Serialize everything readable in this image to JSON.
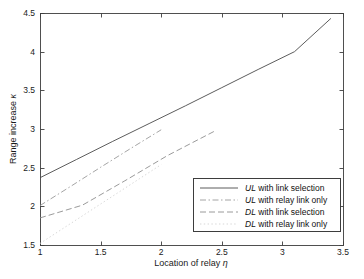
{
  "chart_data": {
    "type": "line",
    "title": "",
    "xlabel": "Location of relay η",
    "xlabel_text": "Location of relay",
    "xlabel_symbol": "η",
    "ylabel": "Range increase κ",
    "ylabel_text": "Range increase",
    "ylabel_symbol": "κ",
    "xlim": [
      1,
      3.5
    ],
    "ylim": [
      1.5,
      4.5
    ],
    "xticks": [
      1,
      1.5,
      2,
      2.5,
      3,
      3.5
    ],
    "xticklabels": [
      "1",
      "1.5",
      "2",
      "2.5",
      "3",
      "3.5"
    ],
    "yticks": [
      1.5,
      2,
      2.5,
      3,
      3.5,
      4,
      4.5
    ],
    "yticklabels": [
      "1.5",
      "2",
      "2.5",
      "3",
      "3.5",
      "4",
      "4.5"
    ],
    "grid": false,
    "legend_position": "lower right",
    "series": [
      {
        "name": "UL with link selection",
        "label_prefix": "UL",
        "label_rest": " with link selection",
        "style": "solid",
        "color": "#4a4a4a",
        "x": [
          1.0,
          1.3,
          1.6,
          1.9,
          2.2,
          2.5,
          2.8,
          3.1,
          3.4
        ],
        "y": [
          2.37,
          2.605,
          2.84,
          3.07,
          3.3,
          3.535,
          3.77,
          4.0,
          4.43
        ]
      },
      {
        "name": "UL with relay link only",
        "label_prefix": "UL",
        "label_rest": " with relay link only",
        "style": "dashdot",
        "color": "#9a9a9a",
        "x": [
          1.0,
          1.25,
          1.5,
          1.75,
          2.0
        ],
        "y": [
          2.01,
          2.255,
          2.505,
          2.75,
          2.99
        ]
      },
      {
        "name": "DL with link selection",
        "label_prefix": "DL",
        "label_rest": " with link selection",
        "style": "dashed",
        "color": "#8e8e8e",
        "x": [
          1.0,
          1.35,
          1.7,
          2.05,
          2.45
        ],
        "y": [
          1.85,
          2.015,
          2.33,
          2.655,
          2.98
        ]
      },
      {
        "name": "DL with relay link only",
        "label_prefix": "DL",
        "label_rest": " with relay link only",
        "style": "dotted",
        "color": "#d2d2d2",
        "x": [
          1.0,
          1.25,
          1.5,
          1.75,
          2.0
        ],
        "y": [
          1.52,
          1.775,
          2.03,
          2.285,
          2.54
        ]
      }
    ]
  },
  "axes": {
    "frame_color": "#3d3d3d"
  }
}
